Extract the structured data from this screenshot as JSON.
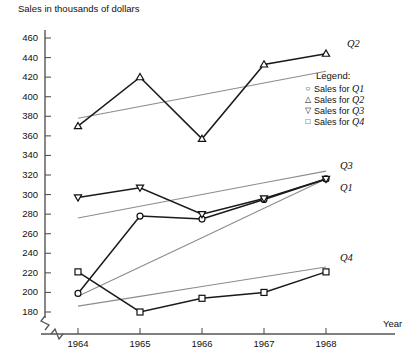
{
  "chart_data": {
    "type": "line",
    "title": "",
    "ylabel": "Sales in thousands of dollars",
    "xlabel": "Year",
    "x": [
      1964,
      1965,
      1966,
      1967,
      1968
    ],
    "xticklabels": [
      "1964",
      "1965",
      "1966",
      "1967",
      "1968"
    ],
    "ylim": [
      180,
      460
    ],
    "yticks": [
      180,
      200,
      220,
      240,
      260,
      280,
      300,
      320,
      340,
      360,
      380,
      400,
      420,
      440,
      460
    ],
    "yticklabels": [
      "180",
      "200",
      "220",
      "240",
      "260",
      "280",
      "300",
      "320",
      "340",
      "360",
      "380",
      "400",
      "420",
      "440",
      "460"
    ],
    "axis_break": true,
    "grid": false,
    "legend_position": "right",
    "series": [
      {
        "name": "Q1",
        "label": "Sales for Q1",
        "marker": "circle",
        "values": [
          199,
          278,
          275,
          295,
          316
        ],
        "trend": [
          196,
          226,
          256,
          286,
          316
        ],
        "color": "#1a1a1a"
      },
      {
        "name": "Q2",
        "label": "Sales for Q2",
        "marker": "triangle-up",
        "values": [
          370,
          420,
          357,
          433,
          444
        ],
        "trend": [
          378,
          390,
          402,
          414,
          426
        ],
        "color": "#1a1a1a"
      },
      {
        "name": "Q3",
        "label": "Sales for Q3",
        "marker": "triangle-down",
        "values": [
          297,
          307,
          280,
          296,
          316
        ],
        "trend": [
          276,
          288,
          300,
          312,
          324
        ],
        "color": "#1a1a1a"
      },
      {
        "name": "Q4",
        "label": "Sales for Q4",
        "marker": "square",
        "values": [
          221,
          180,
          194,
          200,
          221
        ],
        "trend": [
          186,
          196,
          206,
          216,
          226
        ],
        "color": "#1a1a1a"
      }
    ],
    "series_end_labels": [
      "Q2",
      "Q3",
      "Q1",
      "Q4"
    ],
    "trend_color": "#8c8c8c"
  },
  "legend": {
    "title": "Legend:",
    "entries": [
      {
        "marker": "circle",
        "text": "Sales for ",
        "series": "Q1"
      },
      {
        "marker": "triangle-up",
        "text": "Sales for ",
        "series": "Q2"
      },
      {
        "marker": "triangle-down",
        "text": "Sales for ",
        "series": "Q3"
      },
      {
        "marker": "square",
        "text": "Sales for ",
        "series": "Q4"
      }
    ]
  }
}
